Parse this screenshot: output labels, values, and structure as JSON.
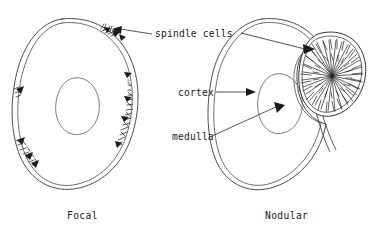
{
  "figure": {
    "background_color": "#ffffff",
    "line_color": "#333333",
    "text_color": "#1a1a1a"
  },
  "labels": {
    "spindle_cells": "spindle cells",
    "cortex": "cortex",
    "medulla": "medulla"
  },
  "captions": {
    "left": "Focal",
    "right": "Nodular"
  },
  "panels": [
    {
      "id": "focal",
      "caption": "Focal",
      "description": "Ovoid gland cross-section with inner medulla oval and focal patches of spindle cells along the cortical rim",
      "spindle_pattern": "focal patches",
      "regions": [
        "cortex",
        "medulla"
      ]
    },
    {
      "id": "nodular",
      "caption": "Nodular",
      "description": "Ovoid gland cross-section with inner medulla oval and a single large protruding nodule of radiating spindle cells on the lateral surface",
      "spindle_pattern": "discrete nodule",
      "regions": [
        "cortex",
        "medulla",
        "nodule"
      ]
    }
  ],
  "annotations": [
    {
      "label": "spindle cells",
      "target_panel": "focal",
      "target": "cortical spindle cell patch"
    },
    {
      "label": "spindle cells",
      "target_panel": "nodular",
      "target": "spindle cell nodule"
    },
    {
      "label": "cortex",
      "target_panel": "nodular",
      "target": "cortex"
    },
    {
      "label": "medulla",
      "target_panel": "nodular",
      "target": "medulla"
    }
  ]
}
